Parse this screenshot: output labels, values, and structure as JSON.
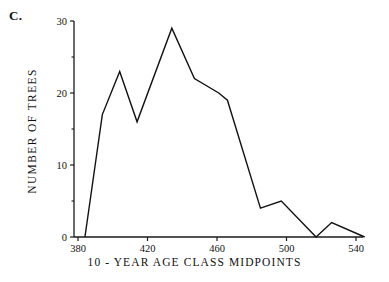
{
  "panel": {
    "label": "C."
  },
  "chart_data": {
    "type": "line",
    "title": "",
    "subtitle": "",
    "xlabel": "10 - YEAR  AGE  CLASS  MIDPOINTS",
    "ylabel": "NUMBER  OF  TREES",
    "xlim": [
      376,
      544
    ],
    "ylim": [
      0,
      30
    ],
    "grid": false,
    "legend": null,
    "x_ticks": [
      380,
      420,
      460,
      500,
      540
    ],
    "x_tick_labels": [
      "380",
      "420",
      "460",
      "500",
      "540"
    ],
    "x_minor_ticks": [
      400,
      440,
      480,
      520
    ],
    "y_ticks": [
      0,
      10,
      20,
      30
    ],
    "y_tick_labels": [
      "0",
      "10",
      "20",
      "30"
    ],
    "y_minor_ticks": [
      5,
      15,
      25
    ],
    "series": [
      {
        "name": "Number of trees",
        "color": "#111111",
        "x": [
          384,
          389,
          394,
          399,
          404,
          409,
          414,
          419,
          424,
          429,
          434,
          439,
          444,
          449,
          454,
          459,
          464,
          469,
          474,
          479,
          484,
          489,
          494,
          499,
          504,
          509,
          514,
          519,
          524,
          529,
          534,
          539,
          544
        ],
        "y": [
          0,
          8,
          17,
          20,
          23,
          20,
          16,
          20,
          24,
          26,
          29,
          25,
          22,
          21,
          20,
          20,
          19,
          16,
          10,
          4,
          4,
          5,
          4,
          3,
          2,
          1,
          0,
          1,
          2,
          1.5,
          1,
          0.5,
          0
        ]
      }
    ],
    "vertices": [
      {
        "x": 384,
        "y": 0
      },
      {
        "x": 394,
        "y": 17
      },
      {
        "x": 404,
        "y": 23
      },
      {
        "x": 414,
        "y": 16
      },
      {
        "x": 434,
        "y": 29
      },
      {
        "x": 447,
        "y": 22
      },
      {
        "x": 461,
        "y": 20
      },
      {
        "x": 466,
        "y": 19
      },
      {
        "x": 485,
        "y": 4
      },
      {
        "x": 497,
        "y": 5
      },
      {
        "x": 517,
        "y": 0
      },
      {
        "x": 526,
        "y": 2
      },
      {
        "x": 545,
        "y": 0
      }
    ]
  }
}
